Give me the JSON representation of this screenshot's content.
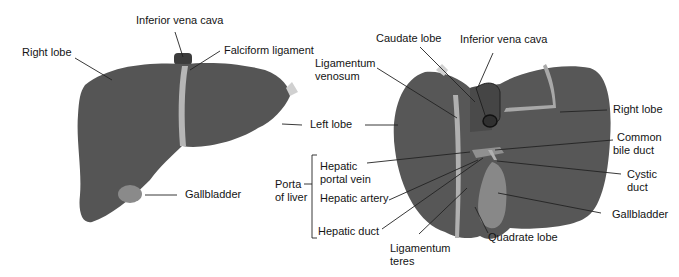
{
  "figure": {
    "colors": {
      "liver": "#5a5a5a",
      "liver_dark": "#4a4a4a",
      "ligament": "#b8b8b8",
      "gallbladder": "#8a8a8a",
      "leader": "#222222"
    },
    "anterior_view": {
      "labels": {
        "ivc": "Inferior vena cava",
        "right_lobe": "Right lobe",
        "falciform": "Falciform ligament",
        "left_lobe": "Left lobe",
        "gallbladder": "Gallbladder"
      }
    },
    "posterior_view": {
      "labels": {
        "caudate": "Caudate lobe",
        "ivc": "Inferior vena cava",
        "lig_venosum_1": "Ligamentum",
        "lig_venosum_2": "venosum",
        "right_lobe": "Right lobe",
        "common_bile_1": "Common",
        "common_bile_2": "bile duct",
        "cystic_1": "Cystic",
        "cystic_2": "duct",
        "gallbladder": "Gallbladder",
        "quadrate": "Quadrate lobe",
        "lig_teres_1": "Ligamentum",
        "lig_teres_2": "teres",
        "porta_1": "Porta",
        "porta_2": "of liver",
        "hpv_1": "Hepatic",
        "hpv_2": "portal vein",
        "artery": "Hepatic artery",
        "duct": "Hepatic duct"
      }
    }
  }
}
